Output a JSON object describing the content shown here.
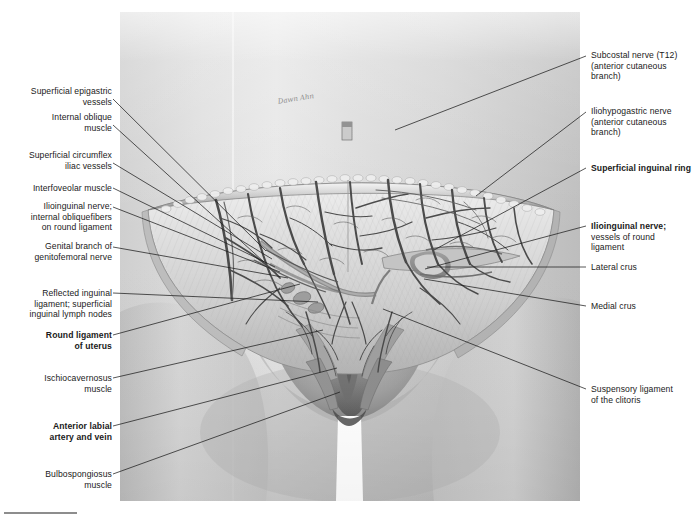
{
  "figure": {
    "kind": "anatomical-illustration",
    "style": "grayscale medical illustration",
    "artist_signature": "Dawn Ahn",
    "background_color": "#d8d8d8",
    "line_color": "#1d1d1d"
  },
  "labels_left": [
    {
      "id": "superficial-epigastric-vessels",
      "text": "Superficial epigastric\nvessels",
      "bold": false,
      "x": 8,
      "y": 86,
      "w": 104,
      "anchor_x": 113,
      "anchor_y": 99,
      "target_x": 266,
      "target_y": 251
    },
    {
      "id": "internal-oblique-muscle",
      "text": "Internal oblique\nmuscle",
      "bold": false,
      "x": 8,
      "y": 112,
      "w": 104,
      "anchor_x": 113,
      "anchor_y": 125,
      "target_x": 264,
      "target_y": 262
    },
    {
      "id": "superficial-circumflex-iliac-vessels",
      "text": "Superficial circumflex\niliac vessels",
      "bold": false,
      "x": 8,
      "y": 150,
      "w": 104,
      "anchor_x": 113,
      "anchor_y": 163,
      "target_x": 272,
      "target_y": 259
    },
    {
      "id": "interfoveolar-muscle",
      "text": "Interfoveolar muscle",
      "bold": false,
      "x": 8,
      "y": 183,
      "w": 104,
      "anchor_x": 113,
      "anchor_y": 188,
      "target_x": 275,
      "target_y": 267
    },
    {
      "id": "ilioinguinal-nerve-internal-oblique-fibers",
      "text": "Ilioinguinal nerve;\ninternal obliquefibers\non round ligament",
      "bold": false,
      "x": 8,
      "y": 201,
      "w": 104,
      "anchor_x": 113,
      "anchor_y": 207,
      "target_x": 280,
      "target_y": 272
    },
    {
      "id": "genital-branch-of-genitofemoral-nerve",
      "text": "Genital branch of\ngenitofemoral nerve",
      "bold": false,
      "x": 8,
      "y": 241,
      "w": 104,
      "anchor_x": 113,
      "anchor_y": 247,
      "target_x": 288,
      "target_y": 278
    },
    {
      "id": "reflected-inguinal-ligament-lymph-nodes",
      "text": "Reflected inguinal\nligament; superficial\ninguinal lymph nodes",
      "bold": false,
      "x": 8,
      "y": 288,
      "w": 104,
      "anchor_x": 113,
      "anchor_y": 293,
      "target_x": 318,
      "target_y": 302
    },
    {
      "id": "round-ligament-of-uterus",
      "text": "Round ligament\nof uterus",
      "bold": true,
      "x": 8,
      "y": 330,
      "w": 104,
      "anchor_x": 113,
      "anchor_y": 335,
      "target_x": 300,
      "target_y": 284
    },
    {
      "id": "ischiocavernosus-muscle",
      "text": "Ischiocavernosus\nmuscle",
      "bold": false,
      "x": 8,
      "y": 373,
      "w": 104,
      "anchor_x": 113,
      "anchor_y": 378,
      "target_x": 323,
      "target_y": 330
    },
    {
      "id": "anterior-labial-artery-and-vein",
      "text": "Anterior labial\nartery and vein",
      "bold": true,
      "x": 8,
      "y": 421,
      "w": 104,
      "anchor_x": 113,
      "anchor_y": 426,
      "target_x": 337,
      "target_y": 368
    },
    {
      "id": "bulbospongiosus-muscle",
      "text": "Bulbospongiosus\nmuscle",
      "bold": false,
      "x": 8,
      "y": 469,
      "w": 104,
      "anchor_x": 113,
      "anchor_y": 474,
      "target_x": 340,
      "target_y": 392
    }
  ],
  "labels_right": [
    {
      "id": "subcostal-nerve-t12",
      "text": "Subcostal nerve (T12)\n(anterior cutaneous\nbranch)",
      "bold": false,
      "x": 591,
      "y": 50,
      "w": 104,
      "anchor_x": 586,
      "anchor_y": 56,
      "target_x": 395,
      "target_y": 130
    },
    {
      "id": "iliohypogastric-nerve",
      "text": "Iliohypogastric nerve\n(anterior cutaneous\nbranch)",
      "bold": false,
      "x": 591,
      "y": 106,
      "w": 104,
      "anchor_x": 586,
      "anchor_y": 112,
      "target_x": 476,
      "target_y": 196
    },
    {
      "id": "superficial-inguinal-ring",
      "text": "Superficial inguinal ring",
      "bold": true,
      "x": 591,
      "y": 163,
      "w": 104,
      "anchor_x": 586,
      "anchor_y": 168,
      "target_x": 434,
      "target_y": 250
    },
    {
      "id": "ilioinguinal-nerve-vessels-of-round-ligament",
      "text": "Ilioinguinal nerve;\nvessels of round\nligament",
      "bold": true,
      "bold_first_line_only": true,
      "x": 591,
      "y": 221,
      "w": 104,
      "anchor_x": 586,
      "anchor_y": 226,
      "target_x": 425,
      "target_y": 269
    },
    {
      "id": "lateral-crus",
      "text": "Lateral crus",
      "bold": false,
      "x": 591,
      "y": 262,
      "w": 104,
      "anchor_x": 586,
      "anchor_y": 267,
      "target_x": 427,
      "target_y": 267
    },
    {
      "id": "medial-crus",
      "text": "Medial crus",
      "bold": false,
      "x": 591,
      "y": 301,
      "w": 104,
      "anchor_x": 586,
      "anchor_y": 306,
      "target_x": 424,
      "target_y": 279
    },
    {
      "id": "suspensory-ligament-of-the-clitoris",
      "text": "Suspensory ligament\nof the clitoris",
      "bold": false,
      "x": 591,
      "y": 384,
      "w": 104,
      "anchor_x": 586,
      "anchor_y": 389,
      "target_x": 383,
      "target_y": 309
    }
  ],
  "bottom_rule": {
    "visible": true,
    "color": "#8d8d8d"
  }
}
